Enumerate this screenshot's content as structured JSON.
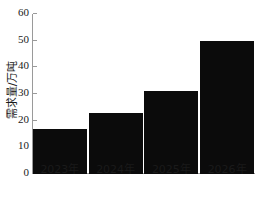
{
  "chart_data": {
    "type": "bar",
    "title": "",
    "subtitle": "",
    "xlabel": "",
    "ylabel": "需求量/万吨",
    "categories": [
      "2023年",
      "2024年",
      "2025年",
      "2026年"
    ],
    "values": [
      16.7,
      23,
      31,
      50
    ],
    "series": [
      {
        "name": "需求量",
        "values": [
          16.7,
          23,
          31,
          50
        ]
      }
    ],
    "ylim": [
      0,
      60
    ],
    "y_ticks": [
      0,
      10,
      20,
      30,
      40,
      50,
      60
    ],
    "y_tick_labels": [
      "0",
      "10",
      "20",
      "30",
      "40",
      "50",
      "60"
    ],
    "grid": false,
    "legend": false,
    "legend_position": "none",
    "bar_color": "#0b0b0b",
    "axis_color": "#9a9a9a",
    "background_color": "#ffffff"
  }
}
